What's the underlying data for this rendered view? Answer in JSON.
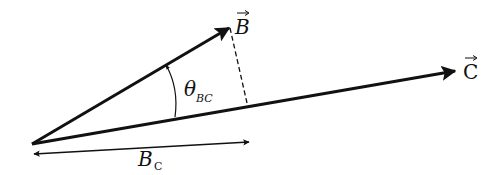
{
  "diagram": {
    "vectors": [
      {
        "name": "B",
        "label": "B",
        "from": [
          32,
          144
        ],
        "to": [
          230,
          27
        ]
      },
      {
        "name": "C",
        "label": "C",
        "from": [
          32,
          144
        ],
        "to": [
          456,
          71
        ]
      }
    ],
    "angle_label": {
      "symbol": "θ",
      "subscript": "BC"
    },
    "projection_label": {
      "symbol": "B",
      "subscript": "C"
    },
    "colors": {
      "line": "#111111",
      "background": "#ffffff"
    }
  }
}
